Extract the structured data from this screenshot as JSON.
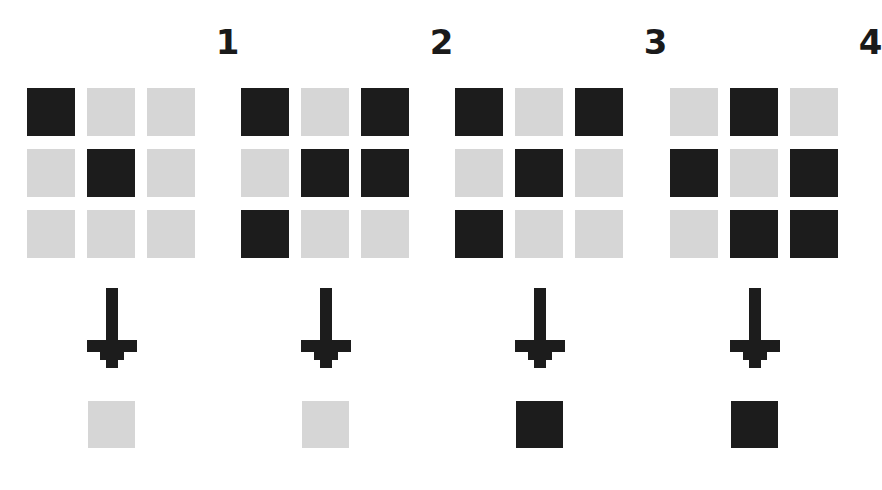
{
  "figure": {
    "background_color": "#ffffff",
    "on_color": "#1c1c1c",
    "off_color": "#d6d6d6",
    "arrow_color": "#1c1c1c",
    "arrow_icon": "arrow-down-icon",
    "grid_rows": 3,
    "grid_cols": 3
  },
  "panels": [
    {
      "label": "1",
      "grid": [
        [
          "on",
          "off",
          "off"
        ],
        [
          "off",
          "on",
          "off"
        ],
        [
          "off",
          "off",
          "off"
        ]
      ],
      "output": "off"
    },
    {
      "label": "2",
      "grid": [
        [
          "on",
          "off",
          "on"
        ],
        [
          "off",
          "on",
          "on"
        ],
        [
          "on",
          "off",
          "off"
        ]
      ],
      "output": "off"
    },
    {
      "label": "3",
      "grid": [
        [
          "on",
          "off",
          "on"
        ],
        [
          "off",
          "on",
          "off"
        ],
        [
          "on",
          "off",
          "off"
        ]
      ],
      "output": "on"
    },
    {
      "label": "4",
      "grid": [
        [
          "off",
          "on",
          "off"
        ],
        [
          "on",
          "off",
          "on"
        ],
        [
          "off",
          "on",
          "on"
        ]
      ],
      "output": "on"
    }
  ]
}
